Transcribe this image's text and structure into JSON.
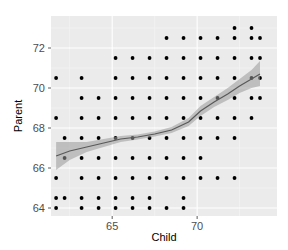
{
  "chart_data": {
    "type": "scatter",
    "title": "",
    "xlabel": "Child",
    "ylabel": "Parent",
    "xlim": [
      61.4,
      74.7
    ],
    "ylim": [
      63.6,
      73.6
    ],
    "x_ticks": [
      65,
      70
    ],
    "y_ticks": [
      64,
      66,
      68,
      70,
      72
    ],
    "grid": true,
    "legend": null,
    "colors": {
      "panel_bg": "#ebebeb",
      "grid_major": "#ffffff",
      "grid_minor": "#f5f5f5",
      "point": "#000000",
      "smooth_line": "#595959",
      "smooth_band": "#999999"
    },
    "points_by_row": [
      {
        "parent": 73.0,
        "child": [
          72.2,
          73.2
        ]
      },
      {
        "parent": 72.5,
        "child": [
          68.2,
          69.2,
          70.2,
          71.2,
          72.2,
          73.2,
          73.7
        ]
      },
      {
        "parent": 71.5,
        "child": [
          65.2,
          66.2,
          67.2,
          68.2,
          69.2,
          70.2,
          71.2,
          72.2,
          73.2,
          73.7
        ]
      },
      {
        "parent": 70.5,
        "child": [
          61.7,
          63.2,
          65.2,
          66.2,
          67.2,
          68.2,
          69.2,
          70.2,
          71.2,
          72.2,
          73.2,
          73.7
        ]
      },
      {
        "parent": 69.5,
        "child": [
          63.2,
          64.2,
          65.2,
          66.2,
          67.2,
          68.2,
          69.2,
          70.2,
          71.2,
          72.2,
          73.2,
          73.7
        ]
      },
      {
        "parent": 68.5,
        "child": [
          61.7,
          63.2,
          64.2,
          65.2,
          66.2,
          67.2,
          68.2,
          69.2,
          70.2,
          71.2,
          72.2,
          73.2
        ]
      },
      {
        "parent": 67.5,
        "child": [
          62.2,
          63.2,
          64.2,
          65.2,
          66.2,
          67.2,
          68.2,
          69.2,
          70.2,
          71.2,
          72.2
        ]
      },
      {
        "parent": 66.5,
        "child": [
          62.2,
          63.2,
          64.2,
          65.2,
          66.2,
          67.2,
          68.2,
          69.2,
          70.2
        ]
      },
      {
        "parent": 65.5,
        "child": [
          61.7,
          63.2,
          64.2,
          65.2,
          66.2,
          67.2,
          68.2,
          69.2,
          70.2,
          71.2,
          72.2
        ]
      },
      {
        "parent": 64.5,
        "child": [
          61.7,
          62.2,
          63.2,
          64.2,
          65.2,
          66.2,
          67.2,
          69.2
        ]
      },
      {
        "parent": 64.0,
        "child": [
          61.7,
          63.2,
          64.2,
          65.2,
          66.2,
          67.2,
          68.2,
          69.2
        ]
      }
    ],
    "smooth": {
      "method": "loess",
      "x": [
        61.7,
        62.5,
        63.5,
        64.5,
        65.5,
        66.5,
        67.5,
        68.5,
        69.5,
        70.2,
        71.0,
        71.8,
        72.5,
        73.2,
        73.7
      ],
      "y": [
        66.6,
        66.85,
        67.05,
        67.25,
        67.45,
        67.55,
        67.7,
        67.9,
        68.3,
        68.85,
        69.3,
        69.7,
        70.1,
        70.45,
        70.7
      ],
      "lower": [
        65.9,
        66.4,
        66.8,
        67.05,
        67.3,
        67.42,
        67.58,
        67.75,
        68.1,
        68.6,
        69.05,
        69.4,
        69.75,
        70.0,
        70.1
      ],
      "upper": [
        67.3,
        67.3,
        67.3,
        67.45,
        67.6,
        67.68,
        67.82,
        68.05,
        68.5,
        69.1,
        69.55,
        70.0,
        70.45,
        70.9,
        71.35
      ]
    }
  }
}
